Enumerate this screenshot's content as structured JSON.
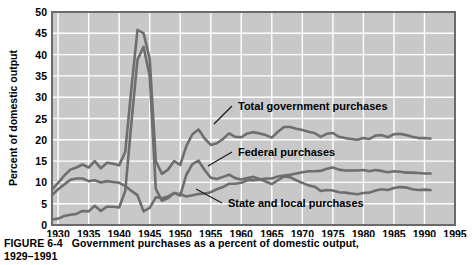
{
  "figure": {
    "caption_label": "FIGURE 6-4",
    "caption_text": "Government purchases as a percent of domestic output,",
    "caption_line2": "1929–1991"
  },
  "colors": {
    "plot_background": "#c8c8c8",
    "grid": "#ffffff",
    "frame": "#6b6b6b",
    "line": "#6e6e6e",
    "text": "#000000",
    "page_background": "#ffffff"
  },
  "annotations": [
    {
      "name": "total-government-purchases",
      "label": "Total government purchases",
      "x": 238,
      "y": 110
    },
    {
      "name": "federal-purchases",
      "label": "Federal purchases",
      "x": 238,
      "y": 156
    },
    {
      "name": "state-and-local-purchases",
      "label": "State and local purchases",
      "x": 228,
      "y": 207
    }
  ],
  "chart_data": {
    "type": "line",
    "title": "Government purchases as a percent of domestic output, 1929–1991",
    "xlabel": "",
    "ylabel": "Percent of domestic output",
    "xlim": [
      1929,
      1995
    ],
    "ylim": [
      0,
      50
    ],
    "ytick_step": 5,
    "yticks": [
      0,
      5,
      10,
      15,
      20,
      25,
      30,
      35,
      40,
      45,
      50
    ],
    "xticks": [
      1930,
      1935,
      1940,
      1945,
      1950,
      1955,
      1960,
      1965,
      1970,
      1975,
      1980,
      1985,
      1990,
      1995
    ],
    "grid": true,
    "legend": "inline-annotations",
    "x": [
      1929,
      1930,
      1931,
      1932,
      1933,
      1934,
      1935,
      1936,
      1937,
      1938,
      1939,
      1940,
      1941,
      1942,
      1943,
      1944,
      1945,
      1946,
      1947,
      1948,
      1949,
      1950,
      1951,
      1952,
      1953,
      1954,
      1955,
      1956,
      1957,
      1958,
      1959,
      1960,
      1961,
      1962,
      1963,
      1964,
      1965,
      1966,
      1967,
      1968,
      1969,
      1970,
      1971,
      1972,
      1973,
      1974,
      1975,
      1976,
      1977,
      1978,
      1979,
      1980,
      1981,
      1982,
      1983,
      1984,
      1985,
      1986,
      1987,
      1988,
      1989,
      1990,
      1991
    ],
    "series": [
      {
        "name": "Total government purchases",
        "values": [
          8.3,
          9.9,
          11.6,
          13.0,
          13.5,
          14.2,
          13.5,
          15.0,
          13.3,
          14.6,
          14.4,
          14.0,
          17.2,
          32.0,
          45.8,
          45.0,
          39.0,
          15.0,
          12.0,
          13.0,
          15.0,
          14.1,
          18.5,
          21.3,
          22.4,
          20.3,
          18.8,
          19.2,
          20.2,
          21.5,
          20.7,
          20.6,
          21.5,
          21.8,
          21.5,
          21.1,
          20.5,
          21.9,
          23.0,
          23.0,
          22.6,
          22.3,
          21.9,
          21.6,
          20.7,
          21.4,
          21.6,
          20.7,
          20.4,
          20.2,
          20.0,
          20.4,
          20.2,
          21.0,
          21.1,
          20.6,
          21.3,
          21.4,
          21.1,
          20.7,
          20.4,
          20.4,
          20.3
        ]
      },
      {
        "name": "Federal purchases",
        "values": [
          1.3,
          1.5,
          2.1,
          2.4,
          2.6,
          3.3,
          3.2,
          4.5,
          3.3,
          4.3,
          4.3,
          4.1,
          8.0,
          24.0,
          38.8,
          41.8,
          35.0,
          8.5,
          5.7,
          6.3,
          7.5,
          6.9,
          11.8,
          14.3,
          15.1,
          12.9,
          11.1,
          10.8,
          11.3,
          11.8,
          11.0,
          10.7,
          11.0,
          11.3,
          10.8,
          10.2,
          9.6,
          10.5,
          11.4,
          11.2,
          10.5,
          9.9,
          9.3,
          9.0,
          8.0,
          8.2,
          8.1,
          7.7,
          7.6,
          7.4,
          7.2,
          7.5,
          7.6,
          8.1,
          8.4,
          8.2,
          8.7,
          8.9,
          8.8,
          8.4,
          8.2,
          8.3,
          8.2
        ]
      },
      {
        "name": "State and local purchases",
        "values": [
          7.0,
          8.4,
          9.5,
          10.6,
          10.9,
          10.9,
          10.3,
          10.5,
          10.0,
          10.3,
          10.1,
          9.9,
          9.2,
          8.0,
          7.0,
          3.2,
          4.0,
          6.5,
          6.3,
          6.7,
          7.5,
          7.2,
          6.7,
          7.0,
          7.3,
          7.4,
          7.7,
          8.4,
          8.9,
          9.7,
          9.7,
          9.9,
          10.5,
          10.5,
          10.7,
          10.9,
          10.9,
          11.4,
          11.6,
          11.8,
          12.1,
          12.4,
          12.6,
          12.6,
          12.7,
          13.2,
          13.5,
          13.0,
          12.8,
          12.8,
          12.8,
          12.9,
          12.6,
          12.9,
          12.7,
          12.4,
          12.6,
          12.5,
          12.3,
          12.3,
          12.2,
          12.1,
          12.1
        ]
      }
    ]
  }
}
